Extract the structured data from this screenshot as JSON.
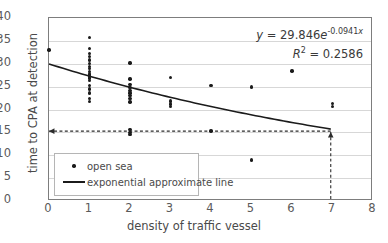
{
  "chart_data": {
    "type": "scatter",
    "title": "",
    "xlabel": "density of traffic vessel",
    "ylabel": "time to CPA at detection",
    "xlim": [
      0,
      8
    ],
    "ylim": [
      0,
      40
    ],
    "xticks": [
      0,
      1,
      2,
      3,
      4,
      5,
      6,
      7,
      8
    ],
    "yticks": [
      0,
      5,
      10,
      15,
      20,
      25,
      30,
      35,
      40
    ],
    "grid": true,
    "legend_position": "bottom-left",
    "series": [
      {
        "name": "open sea",
        "type": "scatter",
        "marker": "dot",
        "color": "#1b1b1b",
        "points": [
          [
            0,
            33.0
          ],
          [
            1,
            35.7
          ],
          [
            1,
            33.3
          ],
          [
            1,
            32.3
          ],
          [
            1,
            31.6
          ],
          [
            1,
            30.8
          ],
          [
            1,
            30.1
          ],
          [
            1,
            29.4
          ],
          [
            1,
            28.9
          ],
          [
            1,
            28.3
          ],
          [
            1,
            27.8
          ],
          [
            1,
            27.3
          ],
          [
            1,
            26.9
          ],
          [
            1,
            26.4
          ],
          [
            1,
            25.2
          ],
          [
            1,
            24.5
          ],
          [
            1,
            23.6
          ],
          [
            1,
            22.4
          ],
          [
            1,
            21.8
          ],
          [
            2,
            30.2
          ],
          [
            2,
            26.7
          ],
          [
            2,
            25.4
          ],
          [
            2,
            24.8
          ],
          [
            2,
            24.2
          ],
          [
            2,
            23.6
          ],
          [
            2,
            23.0
          ],
          [
            2,
            22.4
          ],
          [
            2,
            21.6
          ],
          [
            2,
            15.6
          ],
          [
            2,
            15.0
          ],
          [
            2,
            14.5
          ],
          [
            3,
            27.0
          ],
          [
            3,
            21.9
          ],
          [
            3,
            21.2
          ],
          [
            3,
            20.6
          ],
          [
            4,
            25.2
          ],
          [
            4,
            15.3
          ],
          [
            5,
            24.9
          ],
          [
            5,
            9.0
          ],
          [
            6,
            28.4
          ],
          [
            7,
            21.3
          ],
          [
            7,
            20.6
          ]
        ]
      },
      {
        "name": "exponential approximate line",
        "type": "line",
        "color": "#1b1b1b",
        "equation_a": 29.846,
        "equation_b": -0.0941,
        "x_start": 0,
        "x_end": 7,
        "y_start": 29.85,
        "y_end": 15.45
      }
    ],
    "annotations": [
      {
        "name": "equation",
        "text": "y = 29.846e",
        "exponent": "-0.0941",
        "exponent_var": "x"
      },
      {
        "name": "r-squared",
        "text_pre": "R",
        "superscript": "2",
        "text_post": " = 0.2586"
      }
    ],
    "guides": [
      {
        "name": "horizontal-dashed-guide",
        "y": 15,
        "x_from": 7,
        "x_to": 0,
        "arrow": "left",
        "style": "dashed"
      },
      {
        "name": "vertical-dashed-guide",
        "x": 7,
        "y_from": 0,
        "y_to": 15,
        "arrow": "up",
        "style": "dashed"
      }
    ]
  },
  "legend": {
    "items": [
      {
        "label": "open sea",
        "key": "dot-marker"
      },
      {
        "label": "exponential approximate line",
        "key": "line-marker"
      }
    ]
  },
  "equation": {
    "lhs": "y",
    "eq": "=",
    "coefficient": "29.846",
    "base": "e",
    "exponent": "-0.0941",
    "exponent_var": "x",
    "r2_label": "R",
    "r2_sup": "2",
    "r2_eq": "=",
    "r2_value": "0.2586"
  },
  "axes": {
    "x_title": "density of traffic vessel",
    "y_title": "time to CPA at detection",
    "x_ticks": [
      "0",
      "1",
      "2",
      "3",
      "4",
      "5",
      "6",
      "7",
      "8"
    ],
    "y_ticks": [
      "0",
      "5",
      "10",
      "15",
      "20",
      "25",
      "30",
      "35",
      "40"
    ]
  },
  "colors": {
    "marker": "#1b1b1b",
    "trendline": "#1b1b1b",
    "grid": "#d7d7d7",
    "frame": "#7d7d7d",
    "text": "#4a4a4a"
  }
}
